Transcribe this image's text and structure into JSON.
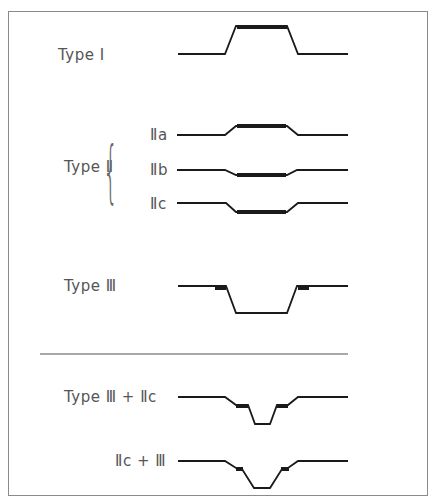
{
  "figure": {
    "title_partial": "",
    "labels": {
      "type1": "Type Ⅰ",
      "type2": "Type Ⅱ",
      "type2a": "Ⅱa",
      "type2b": "Ⅱb",
      "type2c": "Ⅱc",
      "type3": "Type Ⅲ",
      "type3_2c": "Type Ⅲ + Ⅱc",
      "type2c_3": "Ⅱc + Ⅲ"
    },
    "colors": {
      "line": "#1a1a1a",
      "label": "#555555",
      "frame": "#8a8a8a"
    }
  }
}
